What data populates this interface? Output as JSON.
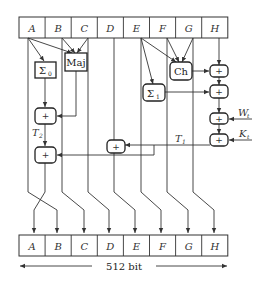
{
  "top_register": [
    "A",
    "B",
    "C",
    "D",
    "E",
    "F",
    "G",
    "H"
  ],
  "bottom_register": [
    "A",
    "B",
    "C",
    "D",
    "E",
    "F",
    "G",
    "H"
  ],
  "functions": {
    "sigma0": {
      "symbol": "Σ",
      "sub": "0"
    },
    "maj": "Maj",
    "ch": "Ch",
    "sigma1": {
      "symbol": "Σ",
      "sub": "1"
    }
  },
  "adder_symbol": "+",
  "labels": {
    "t1": {
      "main": "T",
      "sub": "1"
    },
    "t2": {
      "main": "T",
      "sub": "2"
    },
    "wt": {
      "main": "W",
      "sub": "t"
    },
    "kt": {
      "main": "K",
      "sub": "t"
    }
  },
  "width_label": "512 bit"
}
